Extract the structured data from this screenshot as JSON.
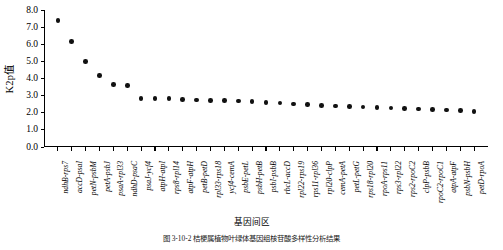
{
  "chart_data": {
    "type": "scatter",
    "title": "",
    "ylabel": "K2p值",
    "xlabel": "基因间区",
    "ylim": [
      0.0,
      8.0
    ],
    "yticks": [
      "0.0",
      "1.0",
      "2.0",
      "3.0",
      "4.0",
      "5.0",
      "6.0",
      "7.0",
      "8.0"
    ],
    "ytick_values": [
      0.0,
      1.0,
      2.0,
      3.0,
      4.0,
      5.0,
      6.0,
      7.0,
      8.0
    ],
    "grid": false,
    "legend": false,
    "marker": "filled-diamond",
    "marker_color": "#111111",
    "categories": [
      "ndhB-rps7",
      "accD-psaI",
      "petN-psbM",
      "petA-psbJ",
      "psaA-rpl33",
      "ndhD-psaC",
      "psaJ-ycf4",
      "atpH-atpI",
      "rps8-rpl14",
      "atpF-atpH",
      "petB-petD",
      "rpl33-rps18",
      "ycf4-cemA",
      "psbE-petL",
      "psbH-petB",
      "psbI-psbB",
      "rbcL-accD",
      "rpl22-rps19",
      "rps11-rpl36",
      "rpl20-clpP",
      "cemA-petA",
      "petL-petG",
      "rps18-rpl20",
      "rpoA-rps11",
      "rps3-rpl22",
      "rps2-rpoC2",
      "clpP-psbB",
      "rpoC2-rpoC1",
      "atpA-atpF",
      "psbN-psbH",
      "petD-rpoA"
    ],
    "values": [
      7.38,
      6.17,
      4.98,
      4.19,
      3.64,
      3.58,
      2.84,
      2.82,
      2.82,
      2.78,
      2.74,
      2.72,
      2.7,
      2.68,
      2.64,
      2.6,
      2.56,
      2.52,
      2.48,
      2.44,
      2.4,
      2.38,
      2.34,
      2.3,
      2.28,
      2.24,
      2.22,
      2.18,
      2.15,
      2.12,
      2.08
    ]
  },
  "caption": {
    "text": "图 3-10-2   桔梗属植物叶绿体基因组核苷酸多样性分析结果"
  }
}
